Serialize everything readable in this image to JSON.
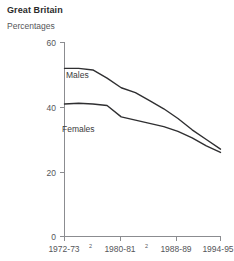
{
  "header": {
    "title": "Great Britain",
    "subtitle": "Percentages"
  },
  "chart_data": {
    "type": "line",
    "title": "Great Britain",
    "subtitle": "Percentages",
    "xlabel": "",
    "ylabel": "",
    "ylim": [
      0,
      60
    ],
    "yticks": [
      0,
      20,
      40,
      60
    ],
    "ytick_labels": [
      "0",
      "20",
      "40",
      "60"
    ],
    "grid": false,
    "legend": "inline-labels",
    "categories": [
      "1972-73",
      "1974-75",
      "1976-77",
      "1978-79",
      "1980-81",
      "1982-83",
      "1984-85",
      "1986-87",
      "1988-89",
      "1990-91",
      "1992-93",
      "1994-95"
    ],
    "xticks": [
      "1972-73",
      "1980-81",
      "1988-89",
      "1994-95"
    ],
    "xtick_labels": [
      "1972-73",
      "1980-81",
      "1988-89",
      "1994-95"
    ],
    "xtick_superscripts": [
      "2",
      "2",
      "",
      ""
    ],
    "series": [
      {
        "name": "Males",
        "color": "#2f2f31",
        "values": [
          52,
          52,
          51.5,
          49,
          46,
          44.5,
          42,
          39.5,
          36.5,
          33,
          30,
          27
        ]
      },
      {
        "name": "Females",
        "color": "#2f2f31",
        "values": [
          41,
          41.2,
          41,
          40.5,
          37,
          36,
          35,
          34,
          32.5,
          30.5,
          28,
          26
        ]
      }
    ]
  },
  "axis": {
    "ytick_0": "0",
    "ytick_20": "20",
    "ytick_40": "40",
    "ytick_60": "60",
    "xtick_1": "1972-73",
    "xtick_1_sup": "2",
    "xtick_2": "1980-81",
    "xtick_2_sup": "2",
    "xtick_3": "1988-89",
    "xtick_4": "1994-95"
  },
  "series_labels": {
    "males": "Males",
    "females": "Females"
  }
}
